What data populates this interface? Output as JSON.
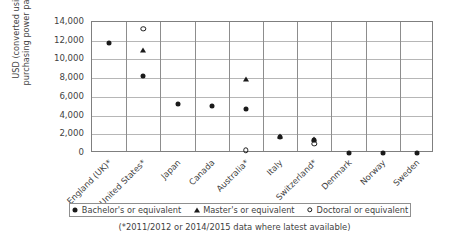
{
  "chart_data": {
    "type": "scatter",
    "title": "",
    "xlabel": "",
    "ylabel_line1": "USD (converted using",
    "ylabel_line2": "purchasing power parity)",
    "ylim": [
      0,
      14000
    ],
    "ytick_step": 2000,
    "yticks": [
      "0",
      "2,000",
      "4,000",
      "6,000",
      "8,000",
      "10,000",
      "12,000",
      "14,000"
    ],
    "grid": true,
    "legend_position": "bottom",
    "categories": [
      "England (UK)*",
      "United States*",
      "Japan",
      "Canada",
      "Australia*",
      "Italy",
      "Switzerland*",
      "Denmark",
      "Norway",
      "Sweden"
    ],
    "series": [
      {
        "name": "Bachelor's or equivalent",
        "marker": "filled-diamond",
        "values": [
          11800,
          8200,
          5200,
          5000,
          4700,
          1700,
          1400,
          0,
          0,
          0
        ]
      },
      {
        "name": "Master's or equivalent",
        "marker": "filled-triangle",
        "values": [
          null,
          11000,
          null,
          null,
          7900,
          1800,
          1500,
          null,
          null,
          null
        ]
      },
      {
        "name": "Doctoral or equivalent",
        "marker": "open-circle",
        "values": [
          null,
          13300,
          null,
          null,
          300,
          null,
          1000,
          null,
          null,
          null
        ]
      }
    ],
    "footnote": "(*2011/2012 or 2014/2015 data where latest available)"
  }
}
